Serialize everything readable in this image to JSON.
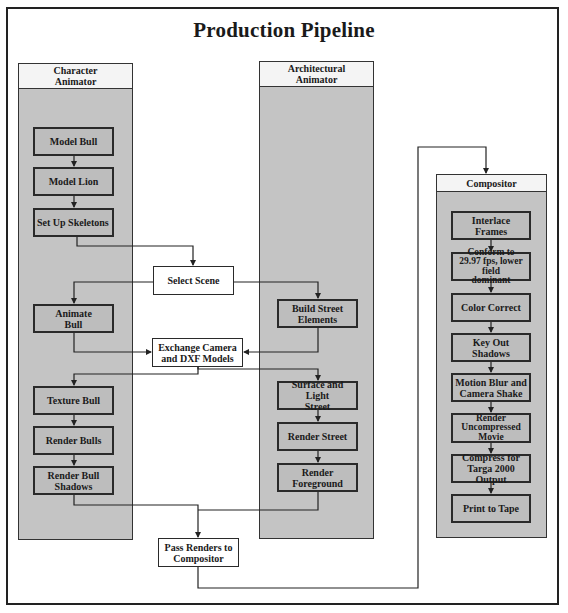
{
  "title": "Production Pipeline",
  "lanes": {
    "character": {
      "label": "Character\nAnimator"
    },
    "architectural": {
      "label": "Architectural\nAnimator"
    },
    "compositor": {
      "label": "Compositor"
    }
  },
  "character_steps": [
    "Model Bull",
    "Model Lion",
    "Set Up Skeletons",
    "Animate\nBull",
    "Texture Bull",
    "Render Bulls",
    "Render Bull\nShadows"
  ],
  "architectural_steps": [
    "Build Street\nElements",
    "Surface and Light\nStreet",
    "Render Street",
    "Render\nForeground"
  ],
  "shared_steps": {
    "select_scene": "Select Scene",
    "exchange": "Exchange Camera\nand DXF Models",
    "pass_renders": "Pass Renders to\nCompositor"
  },
  "compositor_steps": [
    "Interlace Frames",
    "Conform to\n29.97 fps, lower field\ndominant",
    "Color Correct",
    "Key Out Shadows",
    "Motion Blur and\nCamera Shake",
    "Render\nUncompressed\nMovie",
    "Compress for\nTarga 2000 Output",
    "Print to Tape"
  ]
}
